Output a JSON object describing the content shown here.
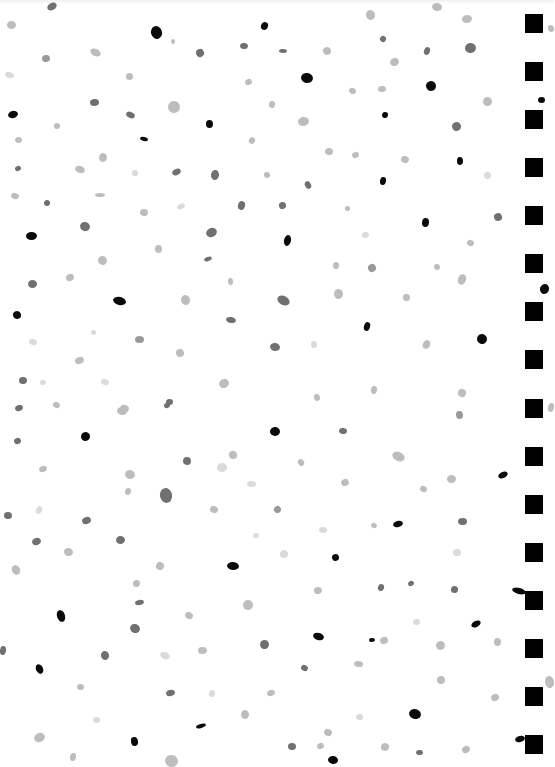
{
  "page": {
    "background": "#ffffff"
  },
  "palette": {
    "black": "#0a0a0a",
    "dark": "#707070",
    "mid": "#9a9a9a",
    "light": "#bdbdbd",
    "pale": "#dadada"
  },
  "binding": {
    "x": 525,
    "size": 18,
    "color": "#000000",
    "holes_y": [
      14,
      62,
      110,
      158,
      206,
      254,
      302,
      350,
      399,
      447,
      495,
      543,
      591,
      639,
      687,
      735
    ]
  },
  "dots": [
    {
      "x": 47,
      "y": 3,
      "w": 10,
      "h": 7,
      "c": "dark"
    },
    {
      "x": 7,
      "y": 21,
      "w": 9,
      "h": 8,
      "c": "light"
    },
    {
      "x": 151,
      "y": 26,
      "w": 11,
      "h": 13,
      "c": "black"
    },
    {
      "x": 261,
      "y": 22,
      "w": 7,
      "h": 8,
      "c": "black"
    },
    {
      "x": 171,
      "y": 39,
      "w": 4,
      "h": 5,
      "c": "light"
    },
    {
      "x": 196,
      "y": 49,
      "w": 8,
      "h": 8,
      "c": "dark"
    },
    {
      "x": 240,
      "y": 43,
      "w": 8,
      "h": 6,
      "c": "dark"
    },
    {
      "x": 42,
      "y": 55,
      "w": 8,
      "h": 7,
      "c": "mid"
    },
    {
      "x": 90,
      "y": 49,
      "w": 11,
      "h": 7,
      "c": "light"
    },
    {
      "x": 126,
      "y": 73,
      "w": 7,
      "h": 7,
      "c": "light"
    },
    {
      "x": 245,
      "y": 79,
      "w": 7,
      "h": 6,
      "c": "light"
    },
    {
      "x": 5,
      "y": 72,
      "w": 9,
      "h": 6,
      "c": "pale"
    },
    {
      "x": 90,
      "y": 99,
      "w": 9,
      "h": 7,
      "c": "dark"
    },
    {
      "x": 168,
      "y": 101,
      "w": 12,
      "h": 12,
      "c": "light"
    },
    {
      "x": 269,
      "y": 101,
      "w": 6,
      "h": 7,
      "c": "light"
    },
    {
      "x": 8,
      "y": 111,
      "w": 10,
      "h": 7,
      "c": "black"
    },
    {
      "x": 126,
      "y": 112,
      "w": 9,
      "h": 6,
      "c": "dark"
    },
    {
      "x": 206,
      "y": 120,
      "w": 7,
      "h": 8,
      "c": "black"
    },
    {
      "x": 54,
      "y": 123,
      "w": 6,
      "h": 6,
      "c": "light"
    },
    {
      "x": 140,
      "y": 137,
      "w": 8,
      "h": 4,
      "c": "black"
    },
    {
      "x": 15,
      "y": 137,
      "w": 7,
      "h": 6,
      "c": "light"
    },
    {
      "x": 249,
      "y": 137,
      "w": 6,
      "h": 7,
      "c": "light"
    },
    {
      "x": 99,
      "y": 153,
      "w": 8,
      "h": 9,
      "c": "light"
    },
    {
      "x": 15,
      "y": 166,
      "w": 6,
      "h": 5,
      "c": "dark"
    },
    {
      "x": 75,
      "y": 166,
      "w": 10,
      "h": 7,
      "c": "light"
    },
    {
      "x": 132,
      "y": 170,
      "w": 6,
      "h": 6,
      "c": "pale"
    },
    {
      "x": 172,
      "y": 169,
      "w": 9,
      "h": 6,
      "c": "dark"
    },
    {
      "x": 211,
      "y": 170,
      "w": 8,
      "h": 10,
      "c": "dark"
    },
    {
      "x": 264,
      "y": 172,
      "w": 6,
      "h": 6,
      "c": "light"
    },
    {
      "x": 11,
      "y": 193,
      "w": 8,
      "h": 6,
      "c": "light"
    },
    {
      "x": 95,
      "y": 193,
      "w": 10,
      "h": 4,
      "c": "light"
    },
    {
      "x": 366,
      "y": 10,
      "w": 9,
      "h": 10,
      "c": "light"
    },
    {
      "x": 432,
      "y": 3,
      "w": 10,
      "h": 8,
      "c": "light"
    },
    {
      "x": 462,
      "y": 15,
      "w": 10,
      "h": 8,
      "c": "light"
    },
    {
      "x": 380,
      "y": 36,
      "w": 6,
      "h": 6,
      "c": "dark"
    },
    {
      "x": 279,
      "y": 49,
      "w": 8,
      "h": 4,
      "c": "dark"
    },
    {
      "x": 323,
      "y": 47,
      "w": 8,
      "h": 8,
      "c": "light"
    },
    {
      "x": 424,
      "y": 47,
      "w": 6,
      "h": 8,
      "c": "dark"
    },
    {
      "x": 465,
      "y": 43,
      "w": 11,
      "h": 10,
      "c": "dark"
    },
    {
      "x": 390,
      "y": 58,
      "w": 9,
      "h": 8,
      "c": "light"
    },
    {
      "x": 301,
      "y": 73,
      "w": 12,
      "h": 10,
      "c": "black"
    },
    {
      "x": 426,
      "y": 81,
      "w": 10,
      "h": 10,
      "c": "black"
    },
    {
      "x": 349,
      "y": 88,
      "w": 7,
      "h": 6,
      "c": "light"
    },
    {
      "x": 378,
      "y": 86,
      "w": 8,
      "h": 6,
      "c": "light"
    },
    {
      "x": 483,
      "y": 97,
      "w": 9,
      "h": 9,
      "c": "light"
    },
    {
      "x": 382,
      "y": 112,
      "w": 6,
      "h": 6,
      "c": "black"
    },
    {
      "x": 298,
      "y": 117,
      "w": 11,
      "h": 9,
      "c": "light"
    },
    {
      "x": 452,
      "y": 122,
      "w": 9,
      "h": 9,
      "c": "dark"
    },
    {
      "x": 325,
      "y": 148,
      "w": 8,
      "h": 7,
      "c": "light"
    },
    {
      "x": 352,
      "y": 152,
      "w": 7,
      "h": 6,
      "c": "light"
    },
    {
      "x": 401,
      "y": 156,
      "w": 8,
      "h": 7,
      "c": "light"
    },
    {
      "x": 457,
      "y": 157,
      "w": 6,
      "h": 8,
      "c": "black"
    },
    {
      "x": 305,
      "y": 181,
      "w": 6,
      "h": 8,
      "c": "dark"
    },
    {
      "x": 380,
      "y": 177,
      "w": 6,
      "h": 8,
      "c": "black"
    },
    {
      "x": 484,
      "y": 172,
      "w": 7,
      "h": 7,
      "c": "pale"
    },
    {
      "x": 44,
      "y": 200,
      "w": 6,
      "h": 6,
      "c": "dark"
    },
    {
      "x": 140,
      "y": 209,
      "w": 8,
      "h": 7,
      "c": "light"
    },
    {
      "x": 177,
      "y": 204,
      "w": 8,
      "h": 5,
      "c": "pale"
    },
    {
      "x": 238,
      "y": 201,
      "w": 7,
      "h": 9,
      "c": "dark"
    },
    {
      "x": 279,
      "y": 202,
      "w": 7,
      "h": 7,
      "c": "dark"
    },
    {
      "x": 345,
      "y": 206,
      "w": 5,
      "h": 5,
      "c": "light"
    },
    {
      "x": 422,
      "y": 218,
      "w": 7,
      "h": 9,
      "c": "black"
    },
    {
      "x": 494,
      "y": 213,
      "w": 8,
      "h": 8,
      "c": "dark"
    },
    {
      "x": 80,
      "y": 222,
      "w": 10,
      "h": 9,
      "c": "dark"
    },
    {
      "x": 26,
      "y": 232,
      "w": 11,
      "h": 8,
      "c": "black"
    },
    {
      "x": 206,
      "y": 228,
      "w": 11,
      "h": 9,
      "c": "dark"
    },
    {
      "x": 284,
      "y": 235,
      "w": 7,
      "h": 11,
      "c": "black"
    },
    {
      "x": 362,
      "y": 232,
      "w": 7,
      "h": 6,
      "c": "pale"
    },
    {
      "x": 467,
      "y": 240,
      "w": 7,
      "h": 6,
      "c": "light"
    },
    {
      "x": 155,
      "y": 245,
      "w": 7,
      "h": 8,
      "c": "light"
    },
    {
      "x": 204,
      "y": 257,
      "w": 8,
      "h": 4,
      "c": "dark"
    },
    {
      "x": 98,
      "y": 256,
      "w": 9,
      "h": 9,
      "c": "light"
    },
    {
      "x": 228,
      "y": 278,
      "w": 5,
      "h": 7,
      "c": "light"
    },
    {
      "x": 368,
      "y": 264,
      "w": 8,
      "h": 8,
      "c": "mid"
    },
    {
      "x": 333,
      "y": 262,
      "w": 6,
      "h": 7,
      "c": "light"
    },
    {
      "x": 434,
      "y": 264,
      "w": 6,
      "h": 6,
      "c": "light"
    },
    {
      "x": 458,
      "y": 274,
      "w": 8,
      "h": 11,
      "c": "light"
    },
    {
      "x": 28,
      "y": 280,
      "w": 9,
      "h": 8,
      "c": "dark"
    },
    {
      "x": 66,
      "y": 274,
      "w": 8,
      "h": 7,
      "c": "light"
    },
    {
      "x": 113,
      "y": 297,
      "w": 13,
      "h": 8,
      "c": "black"
    },
    {
      "x": 181,
      "y": 295,
      "w": 9,
      "h": 10,
      "c": "light"
    },
    {
      "x": 277,
      "y": 296,
      "w": 13,
      "h": 9,
      "c": "dark"
    },
    {
      "x": 334,
      "y": 289,
      "w": 9,
      "h": 10,
      "c": "light"
    },
    {
      "x": 13,
      "y": 311,
      "w": 8,
      "h": 8,
      "c": "black"
    },
    {
      "x": 364,
      "y": 322,
      "w": 6,
      "h": 9,
      "c": "black"
    },
    {
      "x": 403,
      "y": 294,
      "w": 7,
      "h": 7,
      "c": "light"
    },
    {
      "x": 477,
      "y": 334,
      "w": 10,
      "h": 10,
      "c": "black"
    },
    {
      "x": 226,
      "y": 317,
      "w": 10,
      "h": 6,
      "c": "dark"
    },
    {
      "x": 91,
      "y": 330,
      "w": 5,
      "h": 5,
      "c": "pale"
    },
    {
      "x": 29,
      "y": 339,
      "w": 8,
      "h": 6,
      "c": "pale"
    },
    {
      "x": 135,
      "y": 336,
      "w": 9,
      "h": 7,
      "c": "mid"
    },
    {
      "x": 176,
      "y": 349,
      "w": 8,
      "h": 8,
      "c": "light"
    },
    {
      "x": 270,
      "y": 343,
      "w": 10,
      "h": 8,
      "c": "dark"
    },
    {
      "x": 311,
      "y": 341,
      "w": 6,
      "h": 7,
      "c": "pale"
    },
    {
      "x": 423,
      "y": 340,
      "w": 7,
      "h": 9,
      "c": "light"
    },
    {
      "x": 19,
      "y": 377,
      "w": 8,
      "h": 7,
      "c": "dark"
    },
    {
      "x": 75,
      "y": 357,
      "w": 9,
      "h": 7,
      "c": "light"
    },
    {
      "x": 101,
      "y": 379,
      "w": 8,
      "h": 6,
      "c": "pale"
    },
    {
      "x": 40,
      "y": 380,
      "w": 6,
      "h": 5,
      "c": "pale"
    },
    {
      "x": 219,
      "y": 379,
      "w": 10,
      "h": 9,
      "c": "light"
    },
    {
      "x": 371,
      "y": 386,
      "w": 6,
      "h": 8,
      "c": "light"
    },
    {
      "x": 314,
      "y": 394,
      "w": 6,
      "h": 7,
      "c": "light"
    },
    {
      "x": 458,
      "y": 389,
      "w": 8,
      "h": 8,
      "c": "light"
    },
    {
      "x": 166,
      "y": 399,
      "w": 7,
      "h": 6,
      "c": "dark"
    },
    {
      "x": 15,
      "y": 405,
      "w": 8,
      "h": 6,
      "c": "dark"
    },
    {
      "x": 120,
      "y": 405,
      "w": 9,
      "h": 7,
      "c": "light"
    },
    {
      "x": 456,
      "y": 411,
      "w": 7,
      "h": 8,
      "c": "mid"
    },
    {
      "x": 53,
      "y": 402,
      "w": 7,
      "h": 6,
      "c": "light"
    },
    {
      "x": 117,
      "y": 407,
      "w": 10,
      "h": 8,
      "c": "light"
    },
    {
      "x": 164,
      "y": 403,
      "w": 6,
      "h": 5,
      "c": "dark"
    },
    {
      "x": 81,
      "y": 432,
      "w": 9,
      "h": 9,
      "c": "black"
    },
    {
      "x": 270,
      "y": 427,
      "w": 10,
      "h": 9,
      "c": "black"
    },
    {
      "x": 14,
      "y": 438,
      "w": 7,
      "h": 6,
      "c": "dark"
    },
    {
      "x": 339,
      "y": 428,
      "w": 8,
      "h": 6,
      "c": "dark"
    },
    {
      "x": 229,
      "y": 451,
      "w": 8,
      "h": 8,
      "c": "light"
    },
    {
      "x": 392,
      "y": 452,
      "w": 13,
      "h": 9,
      "c": "light"
    },
    {
      "x": 183,
      "y": 457,
      "w": 8,
      "h": 8,
      "c": "dark"
    },
    {
      "x": 39,
      "y": 466,
      "w": 8,
      "h": 6,
      "c": "light"
    },
    {
      "x": 125,
      "y": 470,
      "w": 10,
      "h": 9,
      "c": "light"
    },
    {
      "x": 217,
      "y": 463,
      "w": 10,
      "h": 9,
      "c": "pale"
    },
    {
      "x": 298,
      "y": 459,
      "w": 6,
      "h": 7,
      "c": "light"
    },
    {
      "x": 247,
      "y": 481,
      "w": 9,
      "h": 6,
      "c": "pale"
    },
    {
      "x": 341,
      "y": 479,
      "w": 8,
      "h": 7,
      "c": "light"
    },
    {
      "x": 420,
      "y": 486,
      "w": 7,
      "h": 6,
      "c": "light"
    },
    {
      "x": 447,
      "y": 475,
      "w": 9,
      "h": 8,
      "c": "light"
    },
    {
      "x": 498,
      "y": 472,
      "w": 10,
      "h": 6,
      "c": "black"
    },
    {
      "x": 125,
      "y": 488,
      "w": 6,
      "h": 7,
      "c": "light"
    },
    {
      "x": 160,
      "y": 488,
      "w": 12,
      "h": 15,
      "c": "dark"
    },
    {
      "x": 36,
      "y": 506,
      "w": 6,
      "h": 8,
      "c": "pale"
    },
    {
      "x": 4,
      "y": 512,
      "w": 8,
      "h": 7,
      "c": "dark"
    },
    {
      "x": 82,
      "y": 517,
      "w": 9,
      "h": 7,
      "c": "dark"
    },
    {
      "x": 210,
      "y": 506,
      "w": 8,
      "h": 7,
      "c": "light"
    },
    {
      "x": 253,
      "y": 533,
      "w": 6,
      "h": 5,
      "c": "pale"
    },
    {
      "x": 274,
      "y": 506,
      "w": 7,
      "h": 7,
      "c": "mid"
    },
    {
      "x": 319,
      "y": 527,
      "w": 8,
      "h": 6,
      "c": "pale"
    },
    {
      "x": 393,
      "y": 521,
      "w": 10,
      "h": 6,
      "c": "black"
    },
    {
      "x": 371,
      "y": 523,
      "w": 6,
      "h": 5,
      "c": "light"
    },
    {
      "x": 458,
      "y": 518,
      "w": 9,
      "h": 7,
      "c": "dark"
    },
    {
      "x": 32,
      "y": 538,
      "w": 9,
      "h": 7,
      "c": "dark"
    },
    {
      "x": 64,
      "y": 548,
      "w": 9,
      "h": 8,
      "c": "light"
    },
    {
      "x": 116,
      "y": 536,
      "w": 9,
      "h": 8,
      "c": "dark"
    },
    {
      "x": 156,
      "y": 562,
      "w": 8,
      "h": 8,
      "c": "light"
    },
    {
      "x": 227,
      "y": 562,
      "w": 12,
      "h": 8,
      "c": "black"
    },
    {
      "x": 332,
      "y": 554,
      "w": 7,
      "h": 7,
      "c": "black"
    },
    {
      "x": 280,
      "y": 550,
      "w": 8,
      "h": 8,
      "c": "pale"
    },
    {
      "x": 453,
      "y": 549,
      "w": 8,
      "h": 7,
      "c": "pale"
    },
    {
      "x": 12,
      "y": 565,
      "w": 8,
      "h": 10,
      "c": "light"
    },
    {
      "x": 133,
      "y": 580,
      "w": 7,
      "h": 7,
      "c": "light"
    },
    {
      "x": 314,
      "y": 587,
      "w": 8,
      "h": 7,
      "c": "light"
    },
    {
      "x": 378,
      "y": 584,
      "w": 6,
      "h": 7,
      "c": "dark"
    },
    {
      "x": 451,
      "y": 586,
      "w": 7,
      "h": 7,
      "c": "dark"
    },
    {
      "x": 408,
      "y": 581,
      "w": 6,
      "h": 5,
      "c": "dark"
    },
    {
      "x": 512,
      "y": 588,
      "w": 14,
      "h": 6,
      "c": "black"
    },
    {
      "x": 135,
      "y": 600,
      "w": 9,
      "h": 5,
      "c": "dark"
    },
    {
      "x": 185,
      "y": 612,
      "w": 8,
      "h": 7,
      "c": "light"
    },
    {
      "x": 243,
      "y": 600,
      "w": 10,
      "h": 10,
      "c": "light"
    },
    {
      "x": 57,
      "y": 610,
      "w": 8,
      "h": 12,
      "c": "black"
    },
    {
      "x": 130,
      "y": 624,
      "w": 10,
      "h": 9,
      "c": "dark"
    },
    {
      "x": 413,
      "y": 619,
      "w": 7,
      "h": 6,
      "c": "pale"
    },
    {
      "x": 471,
      "y": 621,
      "w": 10,
      "h": 6,
      "c": "black"
    },
    {
      "x": 0,
      "y": 646,
      "w": 6,
      "h": 9,
      "c": "dark"
    },
    {
      "x": 101,
      "y": 651,
      "w": 8,
      "h": 9,
      "c": "dark"
    },
    {
      "x": 160,
      "y": 652,
      "w": 10,
      "h": 7,
      "c": "pale"
    },
    {
      "x": 198,
      "y": 647,
      "w": 9,
      "h": 7,
      "c": "light"
    },
    {
      "x": 260,
      "y": 640,
      "w": 9,
      "h": 9,
      "c": "dark"
    },
    {
      "x": 313,
      "y": 633,
      "w": 11,
      "h": 7,
      "c": "black"
    },
    {
      "x": 369,
      "y": 638,
      "w": 6,
      "h": 4,
      "c": "black"
    },
    {
      "x": 301,
      "y": 665,
      "w": 7,
      "h": 6,
      "c": "dark"
    },
    {
      "x": 354,
      "y": 661,
      "w": 9,
      "h": 6,
      "c": "light"
    },
    {
      "x": 380,
      "y": 637,
      "w": 8,
      "h": 7,
      "c": "light"
    },
    {
      "x": 436,
      "y": 641,
      "w": 9,
      "h": 9,
      "c": "light"
    },
    {
      "x": 494,
      "y": 638,
      "w": 7,
      "h": 8,
      "c": "light"
    },
    {
      "x": 36,
      "y": 664,
      "w": 7,
      "h": 10,
      "c": "black"
    },
    {
      "x": 77,
      "y": 684,
      "w": 7,
      "h": 6,
      "c": "light"
    },
    {
      "x": 166,
      "y": 690,
      "w": 9,
      "h": 6,
      "c": "dark"
    },
    {
      "x": 209,
      "y": 690,
      "w": 6,
      "h": 7,
      "c": "pale"
    },
    {
      "x": 241,
      "y": 710,
      "w": 8,
      "h": 9,
      "c": "light"
    },
    {
      "x": 267,
      "y": 690,
      "w": 8,
      "h": 6,
      "c": "light"
    },
    {
      "x": 409,
      "y": 709,
      "w": 12,
      "h": 10,
      "c": "black"
    },
    {
      "x": 437,
      "y": 676,
      "w": 8,
      "h": 8,
      "c": "light"
    },
    {
      "x": 491,
      "y": 694,
      "w": 8,
      "h": 7,
      "c": "light"
    },
    {
      "x": 93,
      "y": 717,
      "w": 7,
      "h": 6,
      "c": "pale"
    },
    {
      "x": 196,
      "y": 724,
      "w": 10,
      "h": 4,
      "c": "black"
    },
    {
      "x": 324,
      "y": 729,
      "w": 8,
      "h": 7,
      "c": "light"
    },
    {
      "x": 356,
      "y": 714,
      "w": 7,
      "h": 6,
      "c": "pale"
    },
    {
      "x": 34,
      "y": 733,
      "w": 11,
      "h": 9,
      "c": "light"
    },
    {
      "x": 70,
      "y": 753,
      "w": 6,
      "h": 8,
      "c": "light"
    },
    {
      "x": 131,
      "y": 737,
      "w": 7,
      "h": 9,
      "c": "black"
    },
    {
      "x": 165,
      "y": 755,
      "w": 13,
      "h": 12,
      "c": "light"
    },
    {
      "x": 288,
      "y": 743,
      "w": 8,
      "h": 7,
      "c": "dark"
    },
    {
      "x": 317,
      "y": 743,
      "w": 7,
      "h": 6,
      "c": "light"
    },
    {
      "x": 381,
      "y": 743,
      "w": 8,
      "h": 8,
      "c": "light"
    },
    {
      "x": 416,
      "y": 750,
      "w": 7,
      "h": 5,
      "c": "dark"
    },
    {
      "x": 462,
      "y": 746,
      "w": 8,
      "h": 7,
      "c": "light"
    },
    {
      "x": 328,
      "y": 756,
      "w": 10,
      "h": 8,
      "c": "black"
    },
    {
      "x": 515,
      "y": 736,
      "w": 10,
      "h": 6,
      "c": "black"
    },
    {
      "x": 540,
      "y": 284,
      "w": 9,
      "h": 10,
      "c": "black"
    },
    {
      "x": 538,
      "y": 97,
      "w": 7,
      "h": 6,
      "c": "black"
    },
    {
      "x": 548,
      "y": 25,
      "w": 6,
      "h": 7,
      "c": "light"
    },
    {
      "x": 548,
      "y": 403,
      "w": 6,
      "h": 9,
      "c": "light"
    },
    {
      "x": 545,
      "y": 676,
      "w": 9,
      "h": 12,
      "c": "light"
    }
  ]
}
